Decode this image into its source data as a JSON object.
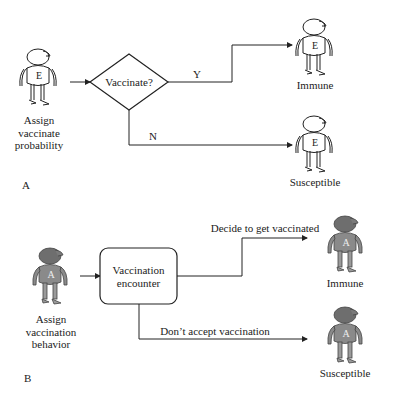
{
  "panel_a": {
    "letter": "A",
    "agent_letter": "E",
    "source_label": [
      "Assign",
      "vaccinate",
      "probability"
    ],
    "decision": "Vaccinate?",
    "yes_label": "Y",
    "no_label": "N",
    "outcome_top": "Immune",
    "outcome_bottom": "Susceptible"
  },
  "panel_b": {
    "letter": "B",
    "agent_letter": "A",
    "source_label": [
      "Assign",
      "vaccination",
      "behavior"
    ],
    "process": [
      "Vaccination",
      "encounter"
    ],
    "top_edge_label": "Decide to get vaccinated",
    "bottom_edge_label": "Don’t accept vaccination",
    "outcome_top": "Immune",
    "outcome_bottom": "Susceptible"
  },
  "colors": {
    "line": "#222222",
    "agent_a_fill": "#8a8a8a",
    "agent_a_head": "#6e6e6e",
    "agent_e_fill": "#ffffff"
  }
}
